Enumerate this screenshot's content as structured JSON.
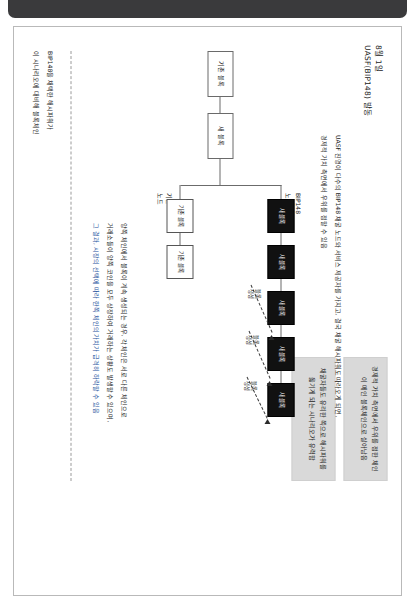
{
  "document": {
    "header_date": "8월 1일",
    "header_title": "UASF(BIP148) 발동"
  },
  "callouts": [
    {
      "id": "callout-a",
      "text": "경제적 가치 측면에서 우위를 점한 체인이 메인 블록체인으로 살아남음"
    },
    {
      "id": "callout-b",
      "text": "채굴자들도 유리한 쪽으로 해시파워를 옮기게 되는 시나리오가 유력함"
    }
  ],
  "nodes": {
    "genesis_left": "기존 블록",
    "genesis_right": "새 블록",
    "new_block": "새 블록",
    "legacy_block": "기존 블록"
  },
  "branches": {
    "upper_label": "BIP148\n노드",
    "upper_label_line1": "BIP148",
    "upper_label_line2": "노드",
    "lower_label_line1": "기존",
    "lower_label_line2": "노드"
  },
  "arrows": {
    "label_line1": "블록",
    "label_line2": "생성"
  },
  "notes": {
    "top": "UASF 진영이 다수의 BIP148 채굴 노드와 서비스 제공자를 가지고, 결국 채굴 해시파워도 따라오게 되면,",
    "top2": "경제적 가치 측면에서 우위를 점할 수 있음",
    "middle1": "양쪽 체인에서 블록이 계속 생성되는 경우, 각 체인은 서로 다른 체인으로",
    "middle2": "거래소들이 양쪽 코인을 모두 상장하여 거래하는 상황도 발생할 수 있으며,",
    "middle3": "그 결과, 시장의 선택에 따라 한쪽 체인의 가치가 급격히 하락할 수 있음",
    "bottom1": "BIP148을 채택한 해시파워가",
    "bottom2": "이 시나리오에 대비해 블록체인"
  }
}
